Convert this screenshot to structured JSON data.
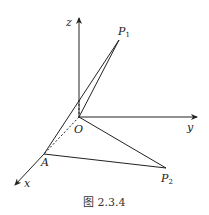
{
  "figure": {
    "caption": "图 2.3.4",
    "axes": {
      "x": "x",
      "y": "y",
      "z": "z"
    },
    "points": {
      "origin": "O",
      "A": "A",
      "P1": {
        "base": "P",
        "sub": "1"
      },
      "P2": {
        "base": "P",
        "sub": "2"
      }
    },
    "colors": {
      "line": "#222222",
      "background": "#ffffff"
    }
  }
}
